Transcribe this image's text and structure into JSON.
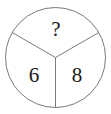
{
  "figure": {
    "name": "divided-circle-puzzle",
    "background_color": "#ffffff",
    "stroke_color": "#7a7a7a",
    "text_color": "#1a1a1a",
    "stroke_width": 1,
    "circle": {
      "center_x": 55.5,
      "center_y": 57.5,
      "radius": 50
    },
    "dividers": [
      {
        "name": "radius-upper-left",
        "angle_degrees": 150,
        "x2": 12.2,
        "y2": 32.5
      },
      {
        "name": "radius-upper-right",
        "angle_degrees": 30,
        "x2": 98.8,
        "y2": 32.5
      },
      {
        "name": "radius-down",
        "angle_degrees": 270,
        "x2": 55.5,
        "y2": 107.5
      }
    ],
    "sectors": [
      {
        "position": "top",
        "label": "?"
      },
      {
        "position": "lower-left",
        "label": "6"
      },
      {
        "position": "lower-right",
        "label": "8"
      }
    ]
  }
}
